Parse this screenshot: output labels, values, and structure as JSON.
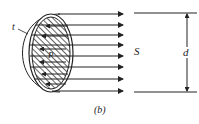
{
  "figure": {
    "caption": "(b)",
    "labels": {
      "thickness": "t",
      "pressure": "P",
      "stress": "S",
      "diameter": "d"
    },
    "arrow_count": 8,
    "colors": {
      "stroke": "#222222",
      "background": "#ffffff"
    }
  }
}
